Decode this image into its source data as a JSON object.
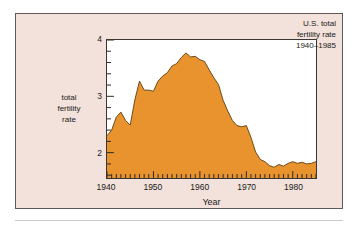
{
  "figure": {
    "background_color": "#f2e2db",
    "plot_background_color": "#ffffff",
    "border_color": "#5e5a59"
  },
  "chart_data": {
    "type": "area",
    "title": "U.S. total fertility rate 1940–1985",
    "title_lines": [
      "U.S. total",
      "fertility rate",
      "1940–1985"
    ],
    "xlabel": "Year",
    "ylabel": "total fertility rate",
    "ylabel_lines": [
      "total",
      "fertility",
      "rate"
    ],
    "xlim": [
      1940,
      1985
    ],
    "ylim": [
      1.55,
      4.0
    ],
    "grid": false,
    "legend": "none",
    "fill_color": "#e8932e",
    "line_color": "#6b4a16",
    "y_ticks": [
      2,
      3,
      4
    ],
    "y_tick_labels": [
      "2",
      "3",
      "4"
    ],
    "y_minor_tick_step": 0.2,
    "x_ticks": [
      1940,
      1950,
      1960,
      1970,
      1980
    ],
    "x_tick_labels": [
      "1940",
      "1950",
      "1960",
      "1970",
      "1980"
    ],
    "x_minor_tick_step": 1,
    "x": [
      1940,
      1941,
      1942,
      1943,
      1944,
      1945,
      1946,
      1947,
      1948,
      1949,
      1950,
      1951,
      1952,
      1953,
      1954,
      1955,
      1956,
      1957,
      1958,
      1959,
      1960,
      1961,
      1962,
      1963,
      1964,
      1965,
      1966,
      1967,
      1968,
      1969,
      1970,
      1971,
      1972,
      1973,
      1974,
      1975,
      1976,
      1977,
      1978,
      1979,
      1980,
      1981,
      1982,
      1983,
      1984,
      1985
    ],
    "values": [
      2.3,
      2.4,
      2.63,
      2.72,
      2.57,
      2.49,
      2.94,
      3.27,
      3.11,
      3.11,
      3.09,
      3.27,
      3.36,
      3.42,
      3.54,
      3.58,
      3.69,
      3.77,
      3.7,
      3.71,
      3.65,
      3.62,
      3.47,
      3.33,
      3.21,
      2.93,
      2.74,
      2.57,
      2.48,
      2.46,
      2.48,
      2.27,
      2.01,
      1.88,
      1.84,
      1.77,
      1.74,
      1.79,
      1.76,
      1.81,
      1.84,
      1.81,
      1.83,
      1.8,
      1.81,
      1.84
    ]
  }
}
